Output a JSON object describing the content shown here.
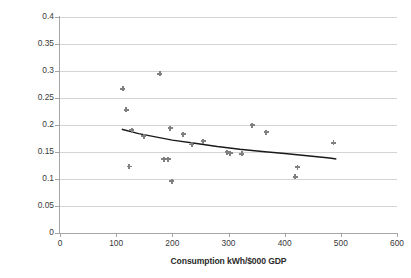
{
  "chart_data": {
    "type": "scatter",
    "title": "",
    "xlabel": "Consumption kWh/$000 GDP",
    "ylabel": "Average industrial and domestic price, $/kWh",
    "xlim": [
      0,
      600
    ],
    "ylim": [
      0,
      0.4
    ],
    "xticks": [
      "0",
      "100",
      "200",
      "300",
      "400",
      "500",
      "600"
    ],
    "xtick_values": [
      0,
      100,
      200,
      300,
      400,
      500,
      600
    ],
    "yticks": [
      "0",
      "0.05",
      "0.1",
      "0.15",
      "0.2",
      "0.25",
      "0.3",
      "0.35",
      "0.4"
    ],
    "ytick_values": [
      0,
      0.05,
      0.1,
      0.15,
      0.2,
      0.25,
      0.3,
      0.35,
      0.4
    ],
    "grid": "horizontal",
    "legend": null,
    "marker_color": "#808080",
    "marker_shape": "plus-diamond",
    "trendline_color": "#1a1a1a",
    "points": [
      {
        "x": 112,
        "y": 0.267
      },
      {
        "x": 118,
        "y": 0.228
      },
      {
        "x": 123,
        "y": 0.123
      },
      {
        "x": 128,
        "y": 0.19
      },
      {
        "x": 149,
        "y": 0.179
      },
      {
        "x": 178,
        "y": 0.295
      },
      {
        "x": 185,
        "y": 0.137
      },
      {
        "x": 193,
        "y": 0.137
      },
      {
        "x": 196,
        "y": 0.194
      },
      {
        "x": 199,
        "y": 0.096
      },
      {
        "x": 219,
        "y": 0.183
      },
      {
        "x": 235,
        "y": 0.164
      },
      {
        "x": 255,
        "y": 0.17
      },
      {
        "x": 298,
        "y": 0.15
      },
      {
        "x": 303,
        "y": 0.148
      },
      {
        "x": 324,
        "y": 0.147
      },
      {
        "x": 342,
        "y": 0.2
      },
      {
        "x": 367,
        "y": 0.187
      },
      {
        "x": 419,
        "y": 0.104
      },
      {
        "x": 423,
        "y": 0.122
      },
      {
        "x": 487,
        "y": 0.167
      }
    ],
    "trendline": {
      "description": "power/log best-fit curve",
      "points": [
        {
          "x": 110,
          "y": 0.192
        },
        {
          "x": 140,
          "y": 0.184
        },
        {
          "x": 170,
          "y": 0.178
        },
        {
          "x": 200,
          "y": 0.172
        },
        {
          "x": 240,
          "y": 0.166
        },
        {
          "x": 280,
          "y": 0.16
        },
        {
          "x": 320,
          "y": 0.155
        },
        {
          "x": 360,
          "y": 0.151
        },
        {
          "x": 400,
          "y": 0.147
        },
        {
          "x": 440,
          "y": 0.143
        },
        {
          "x": 480,
          "y": 0.139
        },
        {
          "x": 492,
          "y": 0.137
        }
      ]
    }
  }
}
